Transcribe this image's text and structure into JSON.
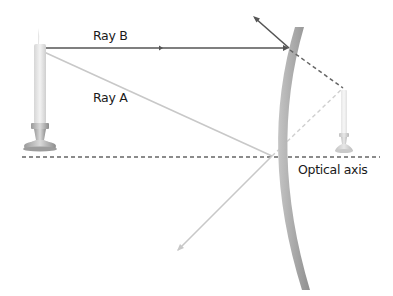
{
  "diagram": {
    "type": "concave-mirror-ray-diagram",
    "labels": {
      "ray_b": "Ray B",
      "ray_a": "Ray A",
      "optical_axis": "Optical axis"
    },
    "colors": {
      "ray_b": "#555555",
      "ray_a": "#c8c8c8",
      "mirror": "#a8a8a8",
      "axis": "#666666",
      "virtual_ray_b": "#666666",
      "virtual_ray_a": "#cfcfcf",
      "candle": "#e4e4e4",
      "holder": "#b0b0b0"
    },
    "elements": [
      "object-candle",
      "image-candle",
      "mirror",
      "optical-axis",
      "ray-a",
      "ray-b"
    ]
  }
}
